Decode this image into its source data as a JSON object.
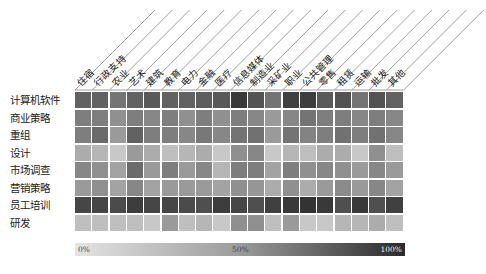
{
  "chart_data": {
    "type": "heatmap",
    "title": "",
    "columns": [
      "住宿",
      "行政支持",
      "农业",
      "艺术",
      "建筑",
      "教育",
      "电力",
      "金融",
      "医疗",
      "信息媒体",
      "制造业",
      "采矿业",
      "职业",
      "公共管理",
      "零售",
      "租赁",
      "运输",
      "批发",
      "其他"
    ],
    "rows": [
      "计算机软件",
      "商业策略",
      "重组",
      "设计",
      "市场调查",
      "营销策略",
      "员工培训",
      "研发"
    ],
    "values": [
      [
        70,
        70,
        60,
        70,
        75,
        70,
        70,
        72,
        75,
        92,
        78,
        60,
        88,
        90,
        75,
        78,
        60,
        78,
        70
      ],
      [
        55,
        55,
        45,
        55,
        50,
        55,
        45,
        55,
        45,
        55,
        50,
        40,
        50,
        60,
        55,
        55,
        50,
        55,
        50
      ],
      [
        55,
        65,
        40,
        70,
        55,
        55,
        50,
        58,
        50,
        60,
        62,
        40,
        60,
        52,
        55,
        62,
        55,
        62,
        50
      ],
      [
        30,
        25,
        15,
        40,
        30,
        20,
        25,
        30,
        15,
        45,
        50,
        15,
        25,
        20,
        30,
        30,
        15,
        45,
        20
      ],
      [
        50,
        45,
        35,
        65,
        40,
        55,
        40,
        50,
        25,
        55,
        55,
        35,
        55,
        45,
        50,
        45,
        40,
        50,
        40
      ],
      [
        40,
        45,
        35,
        50,
        35,
        40,
        40,
        40,
        35,
        45,
        42,
        30,
        45,
        30,
        40,
        48,
        40,
        50,
        35
      ],
      [
        85,
        85,
        82,
        90,
        85,
        85,
        82,
        80,
        90,
        85,
        80,
        88,
        92,
        95,
        92,
        80,
        92,
        80,
        88
      ],
      [
        20,
        20,
        20,
        20,
        15,
        40,
        20,
        25,
        15,
        45,
        45,
        20,
        40,
        15,
        15,
        25,
        25,
        30,
        20
      ]
    ],
    "colorscale": {
      "min_label": "0%",
      "mid_label": "50%",
      "max_label": "100%",
      "min_color": "#e4e4e4",
      "max_color": "#2a2a2a"
    },
    "legend_position": "bottom"
  }
}
